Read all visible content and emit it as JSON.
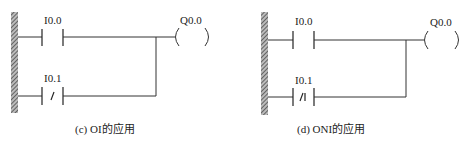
{
  "diagrams": [
    {
      "id": "c",
      "caption": "(c) OI的应用",
      "contact_top": {
        "label": "I0.0",
        "type": "normally-open"
      },
      "contact_bottom": {
        "label": "I0.1",
        "type": "normally-closed",
        "symbol": "/"
      },
      "coil": {
        "label": "Q0.0",
        "left": "(",
        "right": ")"
      }
    },
    {
      "id": "d",
      "caption": "(d) ONI的应用",
      "contact_top": {
        "label": "I0.0",
        "type": "normally-open"
      },
      "contact_bottom": {
        "label": "I0.1",
        "type": "normally-closed",
        "symbol": "/I"
      },
      "coil": {
        "label": "Q0.0",
        "left": "(",
        "right": ")"
      }
    }
  ],
  "colors": {
    "line": "#333333",
    "rail_hatch": "#555555",
    "background": "#ffffff"
  }
}
